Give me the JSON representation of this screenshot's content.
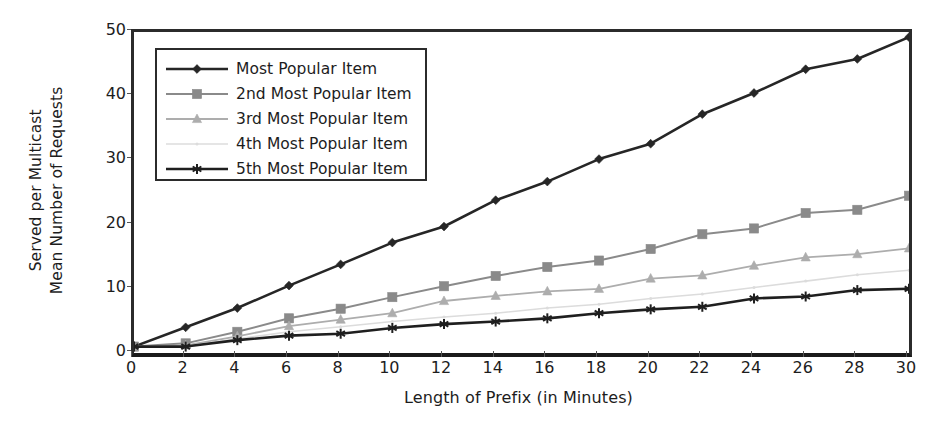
{
  "chart_data": {
    "type": "line",
    "title": "",
    "xlabel": "Length of Prefix (in Minutes)",
    "ylabel_line1": "Mean Number of Requests",
    "ylabel_line2": "Served per Multicast",
    "x": [
      0,
      2,
      4,
      6,
      8,
      10,
      12,
      14,
      16,
      18,
      20,
      22,
      24,
      26,
      28,
      30
    ],
    "xtick_labels": [
      "0",
      "2",
      "4",
      "6",
      "8",
      "10",
      "12",
      "14",
      "16",
      "18",
      "20",
      "22",
      "24",
      "26",
      "28",
      "30"
    ],
    "ytick_labels": [
      "0",
      "10",
      "20",
      "30",
      "40",
      "50"
    ],
    "ytick_values": [
      0,
      10,
      20,
      30,
      40,
      50
    ],
    "xlim": [
      0,
      30
    ],
    "ylim": [
      0,
      50
    ],
    "grid": false,
    "legend_position": "upper-left-inside",
    "series": [
      {
        "name": "Most Popular Item",
        "marker": "diamond",
        "color": "#262626",
        "line_width": 2.6,
        "values": [
          1.0,
          4.0,
          7.0,
          10.5,
          13.8,
          17.2,
          19.7,
          23.8,
          26.7,
          30.2,
          32.6,
          37.2,
          40.5,
          44.2,
          45.8,
          49.2
        ]
      },
      {
        "name": "2nd Most Popular Item",
        "marker": "square",
        "color": "#8a8a8a",
        "line_width": 2.0,
        "values": [
          1.0,
          1.5,
          3.3,
          5.4,
          6.9,
          8.7,
          10.4,
          12.0,
          13.4,
          14.4,
          16.2,
          18.5,
          19.4,
          21.8,
          22.3,
          24.5
        ]
      },
      {
        "name": "3rd Most Popular Item",
        "marker": "triangle",
        "color": "#adadad",
        "line_width": 1.8,
        "values": [
          1.0,
          1.2,
          2.6,
          4.2,
          5.2,
          6.2,
          8.1,
          8.9,
          9.6,
          10.0,
          11.6,
          12.1,
          13.6,
          14.9,
          15.4,
          16.3
        ]
      },
      {
        "name": "4th Most Popular Item",
        "marker": "dot",
        "color": "#dcdcdc",
        "line_width": 1.6,
        "values": [
          1.0,
          1.1,
          2.2,
          3.3,
          4.1,
          4.9,
          5.6,
          6.2,
          7.0,
          7.6,
          8.5,
          9.2,
          10.2,
          11.2,
          12.2,
          12.9
        ]
      },
      {
        "name": "5th Most Popular Item",
        "marker": "star",
        "color": "#1f1f1f",
        "line_width": 2.6,
        "values": [
          1.0,
          1.0,
          2.0,
          2.7,
          3.0,
          3.9,
          4.5,
          4.9,
          5.4,
          6.2,
          6.8,
          7.2,
          8.5,
          8.8,
          9.8,
          10.0
        ]
      }
    ]
  }
}
